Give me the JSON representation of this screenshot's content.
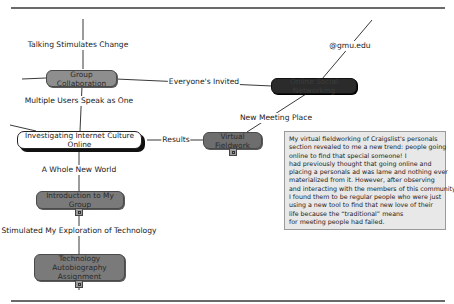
{
  "diagram": {
    "type": "mind-map",
    "central_topic": "Investigating Internet Culture Online",
    "nodes": {
      "group_collaboration": "Group Collaboration",
      "online_social_networking": "Online Social Networking",
      "virtual_fieldwork": "Virtual Fieldwork",
      "introduction": "Introduction to My Group",
      "tech_autobiography_line1": "Technology Autobiography",
      "tech_autobiography_line2": "Assignment"
    },
    "links": {
      "talking_stimulates_change": "Talking Stimulates Change",
      "everyones_invited": "Everyone's Invited",
      "multiple_users": "Multiple Users Speak as One",
      "results": "Results",
      "gmu_edu": "@gmu.edu",
      "new_meeting_place": "New Meeting Place",
      "whole_new_world": "A Whole New World",
      "stimulated_exploration": "Stimulated My Exploration of Technology"
    },
    "note": {
      "lines": [
        "My virtual fieldworking of Craigslist's personals",
        "section revealed to me a new trend: people going",
        "online to find that special someone! I",
        "had previously thought that going online and",
        "placing a personals ad was lame and nothing ever",
        "materialized from it. However, after observing",
        "and interacting with the members of this community,",
        "I found them to be regular people who were just",
        "using a new tool to find that new love of their",
        "life because the “traditional” means",
        "for meeting people had failed."
      ]
    },
    "colors": {
      "gray_node": "#8e8e8e",
      "dark_node": "#2b2b2b",
      "note_bg": "#e8e8e8",
      "rule": "#6a6a6a"
    }
  }
}
